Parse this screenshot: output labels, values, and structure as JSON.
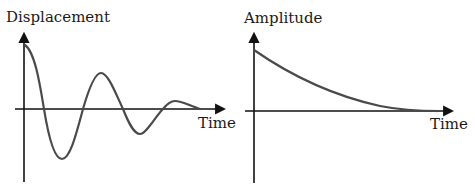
{
  "diagrams": [
    {
      "id": "damped-oscillation",
      "y_label": "Displacement",
      "x_label": "Time",
      "description": "Damped oscillation: displacement vs time decaying sinusoid"
    },
    {
      "id": "amplitude-decay",
      "y_label": "Amplitude",
      "x_label": "Time",
      "description": "Exponential decay of amplitude vs time"
    }
  ],
  "colors": {
    "axis": "#111111",
    "curve": "#4a4a4a",
    "background": "#ffffff"
  }
}
